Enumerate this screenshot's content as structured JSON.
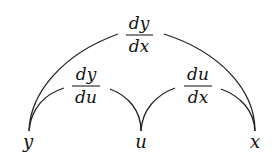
{
  "diagram": {
    "type": "chain-rule-diagram",
    "nodes": [
      {
        "id": "y",
        "label": "y",
        "x": 28,
        "y": 148
      },
      {
        "id": "u",
        "label": "u",
        "x": 141,
        "y": 148
      },
      {
        "id": "x",
        "label": "x",
        "x": 255,
        "y": 148
      }
    ],
    "edges": [
      {
        "from": "y",
        "to": "x",
        "numerator": "dy",
        "denominator": "dx",
        "label_x": 139
      },
      {
        "from": "y",
        "to": "u",
        "numerator": "dy",
        "denominator": "du",
        "label_x": 86
      },
      {
        "from": "u",
        "to": "x",
        "numerator": "du",
        "denominator": "dx",
        "label_x": 198
      }
    ],
    "colors": {
      "stroke": "#222222",
      "text": "#111111",
      "background": "#ffffff"
    }
  }
}
